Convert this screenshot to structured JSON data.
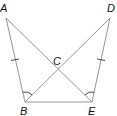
{
  "diagram": {
    "type": "geometry",
    "points": [
      {
        "name": "A",
        "label": "A",
        "x": 6,
        "y": 18,
        "lx": 0,
        "ly": 12
      },
      {
        "name": "D",
        "label": "D",
        "x": 110,
        "y": 18,
        "lx": 108,
        "ly": 12
      },
      {
        "name": "B",
        "label": "B",
        "x": 25,
        "y": 102,
        "lx": 20,
        "ly": 115
      },
      {
        "name": "E",
        "label": "E",
        "x": 92,
        "y": 102,
        "lx": 88,
        "ly": 115
      },
      {
        "name": "C",
        "label": "C",
        "x": 58,
        "y": 70,
        "lx": 54,
        "ly": 64
      }
    ],
    "segments": [
      "AB",
      "DE",
      "BE",
      "AE",
      "BD"
    ],
    "markings": {
      "congruent_sides": [
        "AB",
        "DE"
      ],
      "congruent_angles": [
        "ABE",
        "DEB"
      ]
    },
    "stroke_color": "#8a8a8a",
    "label_color": "#111111"
  }
}
